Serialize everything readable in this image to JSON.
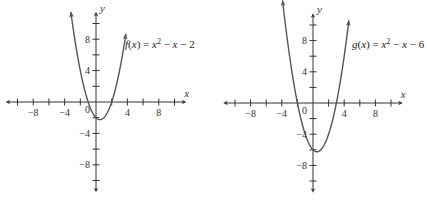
{
  "chart_data": [
    {
      "type": "line",
      "title": "",
      "function_label": "f(x) = x² − x − 2",
      "function_name": "f",
      "equation": {
        "a": 1,
        "b": -1,
        "c": -2
      },
      "xlabel": "x",
      "ylabel": "y",
      "xlim": [
        -11,
        11
      ],
      "ylim": [
        -11,
        11
      ],
      "x_tick_step": 2,
      "y_tick_step": 2,
      "x_tick_labels": [
        "-8",
        "-4",
        "4",
        "8"
      ],
      "y_tick_labels": [
        "8",
        "4",
        "-4",
        "-8"
      ],
      "origin_label": "0",
      "grid": false,
      "x_range_plotted": [
        -3.2,
        3.8
      ],
      "vertex": [
        0.5,
        -2.25
      ],
      "roots": [
        -1,
        2
      ]
    },
    {
      "type": "line",
      "title": "",
      "function_label": "g(x) = x² − x − 6",
      "function_name": "g",
      "equation": {
        "a": 1,
        "b": -1,
        "c": -6
      },
      "xlabel": "x",
      "ylabel": "y",
      "xlim": [
        -11,
        11
      ],
      "ylim": [
        -11,
        11
      ],
      "x_tick_step": 2,
      "y_tick_step": 2,
      "x_tick_labels": [
        "-8",
        "-4",
        "4",
        "8"
      ],
      "y_tick_labels": [
        "8",
        "4",
        "-4",
        "-8"
      ],
      "origin_label": "0",
      "grid": false,
      "x_range_plotted": [
        -3.9,
        4.6
      ],
      "vertex": [
        0.5,
        -6.25
      ],
      "roots": [
        -2,
        3
      ]
    }
  ],
  "layout": [
    {
      "origin_x": 96,
      "origin_y": 102,
      "unit": 7.85,
      "label_x": 125,
      "label_y": 48
    },
    {
      "origin_x": 313,
      "origin_y": 103,
      "unit": 7.8,
      "label_x": 352,
      "label_y": 48
    }
  ],
  "colors": {
    "axis": "#333333",
    "curve": "#555555",
    "text": "#222222"
  }
}
